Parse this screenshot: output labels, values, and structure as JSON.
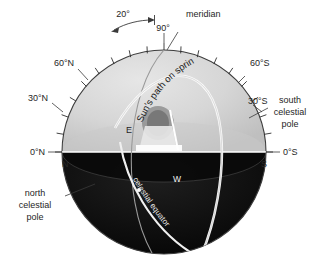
{
  "figure": {
    "type": "celestial-sphere-diagram",
    "background_color": "#ffffff",
    "upper_hemisphere_color": "#d4d4d4",
    "lower_hemisphere_color": "#0d0d0d",
    "horizon_line_color": "#ffffff",
    "path_curve_color": "#f5f5f5",
    "meridian_curve_color": "#8c8c8c"
  },
  "labels": {
    "angle_span": "20°",
    "angle_meridian_top": "90°",
    "meridian": "meridian",
    "lat_60n": "60°N",
    "lat_30n": "30°N",
    "lat_0n": "0°N",
    "lat_60s": "60°S",
    "lat_30s": "30°S",
    "lat_0s": "0°S",
    "cardinal_north": "N",
    "cardinal_south": "S",
    "cardinal_east": "E",
    "cardinal_west": "W",
    "south_pole_line1": "south",
    "south_pole_line2": "celestial",
    "south_pole_line3": "pole",
    "north_pole_line1": "north",
    "north_pole_line2": "celestial",
    "north_pole_line3": "pole",
    "sun_path": "Sun's path on spring equinox",
    "celestial_equator": "celestial equator"
  }
}
